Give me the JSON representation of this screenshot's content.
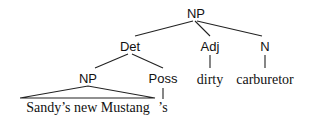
{
  "tree": {
    "root": {
      "label": "NP"
    },
    "det": {
      "label": "Det"
    },
    "adj": {
      "label": "Adj"
    },
    "n": {
      "label": "N"
    },
    "np_child": {
      "label": "NP"
    },
    "poss": {
      "label": "Poss"
    },
    "leaves": {
      "np_child_text": "Sandy’s new Mustang",
      "poss_text": "’s",
      "adj_text": "dirty",
      "n_text": "carburetor"
    }
  }
}
